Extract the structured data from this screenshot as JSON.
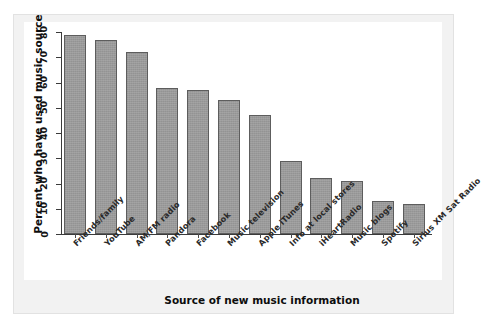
{
  "chart_data": {
    "type": "bar",
    "title": "",
    "xlabel": "Source of new music information",
    "ylabel": "Percent who have used music source",
    "ylim": [
      0,
      80
    ],
    "yticks": [
      0,
      10,
      20,
      30,
      40,
      50,
      60,
      70,
      80
    ],
    "grid": false,
    "legend": null,
    "categories": [
      "Friends/family",
      "YouTube",
      "AM/FM radio",
      "Pandora",
      "Facebook",
      "Music television",
      "Apple iTunes",
      "Info at local stores",
      "iHeartRadio",
      "Music blogs",
      "Spotify",
      "Sirius XM Sat Radio"
    ],
    "values": [
      79,
      77,
      72,
      58,
      57,
      53,
      47,
      29,
      22,
      21,
      13,
      12
    ],
    "bar_color": "#9a9a9a",
    "bar_edge_color": "#5d5d5d",
    "axis_color": "#3a3a3a",
    "plot_background": "#ffffff",
    "figure_background": "#f2f2f2"
  }
}
